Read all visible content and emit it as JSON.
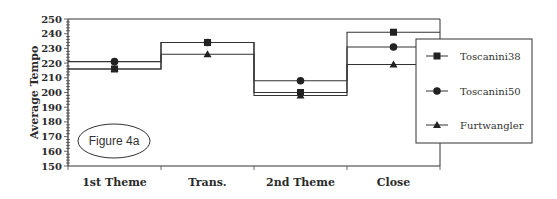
{
  "chart_data": {
    "type": "line",
    "title": "",
    "annotation": "Figure 4a",
    "xlabel": "",
    "ylabel": "Average Tempo",
    "ylim": [
      150,
      250
    ],
    "yticks": [
      150,
      160,
      170,
      180,
      190,
      200,
      210,
      220,
      230,
      240,
      250
    ],
    "categories": [
      "1st Theme",
      "Trans.",
      "2nd Theme",
      "Close"
    ],
    "series": [
      {
        "name": "Toscanini38",
        "marker": "square",
        "values": [
          216,
          234,
          200,
          241
        ]
      },
      {
        "name": "Toscanini50",
        "marker": "circle",
        "values": [
          221,
          234,
          208,
          231
        ]
      },
      {
        "name": "Furtwangler",
        "marker": "triangle",
        "values": [
          216,
          226,
          198,
          219
        ]
      }
    ],
    "grid": false,
    "legend_position": "right",
    "step_style": true
  }
}
